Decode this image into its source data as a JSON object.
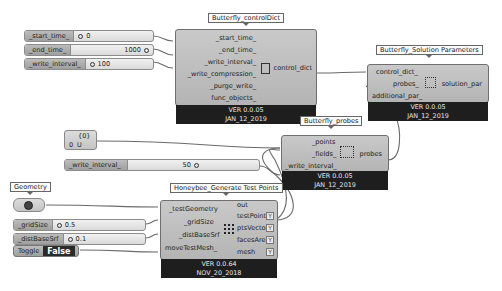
{
  "sliders": [
    {
      "label": "_start_time_",
      "value": "0",
      "value_align": "left"
    },
    {
      "label": "_end_time_",
      "value": "1000",
      "value_align": "right"
    },
    {
      "label": "_write_interval_",
      "value": "100",
      "value_align": "left"
    },
    {
      "label": "_write_interval_",
      "value": "50",
      "value_align": "right"
    },
    {
      "label": "_gridSize",
      "value": "0.5",
      "value_align": "left"
    },
    {
      "label": "_distBaseSrf",
      "value": "0.1",
      "value_align": "left"
    }
  ],
  "components": {
    "control_dict": {
      "title": "Butterfly_controlDict",
      "inputs": [
        "_start_time_",
        "_end_time_",
        "_write_interval_",
        "_write_compression_",
        "_purge_write_",
        "func_objects_"
      ],
      "outputs": [
        "control_dict"
      ],
      "version": "VER 0.0.05",
      "date": "JAN_12_2019"
    },
    "solution_parameters": {
      "title": "Butterfly_Solution Parameters",
      "inputs": [
        "control_dict_",
        "probes_",
        "additional_par_"
      ],
      "outputs": [
        "solution_par"
      ],
      "version": "VER 0.0.05",
      "date": "JAN_12_2019"
    },
    "probes": {
      "title": "Butterfly_probes",
      "inputs": [
        "_points",
        "_fields_",
        "_write_interval_"
      ],
      "outputs": [
        "probes"
      ],
      "version": "VER 0.0.05",
      "date": "JAN_12_2019"
    },
    "test_points": {
      "title": "Honeybee_Generate Test Points",
      "inputs": [
        "_testGeometry",
        "_gridSize",
        "_distBaseSrf",
        "moveTestMesh_"
      ],
      "outputs": [
        "out",
        "testPoints",
        "ptsVectors",
        "facesArea",
        "mesh"
      ],
      "version": "VER 0.0.64",
      "date": "NOV_20_2018"
    }
  },
  "panel": {
    "header": "{0}",
    "row_index": "0",
    "row_value": "U"
  },
  "geometry": {
    "title": "Geometry"
  },
  "toggle": {
    "label": "Toggle",
    "value": "False"
  },
  "colors": {
    "node_fill": "#bebebe",
    "footer": "#1e1e1e",
    "wire": "#6a6a6a",
    "canvas": "#ffffff"
  }
}
